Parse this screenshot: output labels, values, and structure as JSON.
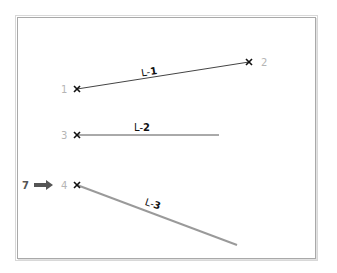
{
  "diagram": {
    "points": [
      {
        "id": "1",
        "label": "1",
        "x": 77,
        "y": 89
      },
      {
        "id": "2",
        "label": "2",
        "x": 249,
        "y": 62
      },
      {
        "id": "3",
        "label": "3",
        "x": 77,
        "y": 135
      },
      {
        "id": "4",
        "label": "4",
        "x": 77,
        "y": 185
      }
    ],
    "lines": [
      {
        "id": "L-1",
        "prefix": "L-",
        "number": "1",
        "from": "1",
        "to": "2"
      },
      {
        "id": "L-2",
        "prefix": "L-",
        "number": "2",
        "from": "3",
        "end_x": 219,
        "end_y": 135
      },
      {
        "id": "L-3",
        "prefix": "L-",
        "number": "3",
        "from": "4",
        "end_x": 237,
        "end_y": 245
      }
    ],
    "callout": {
      "label": "7",
      "icon": "right-arrow-icon",
      "points_to": "4"
    },
    "colors": {
      "point_label": "#b5b5b5",
      "line_dark": "#333333",
      "line_grey": "#9a9a9a",
      "arrow": "#555555",
      "frame": "#a9a9a9"
    }
  }
}
